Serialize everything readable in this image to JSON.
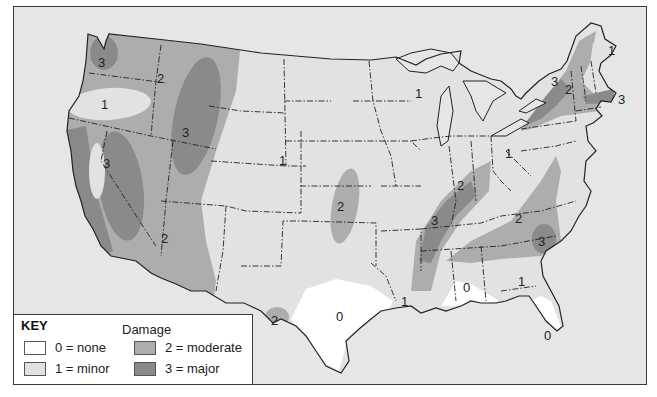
{
  "map": {
    "title": "Damage",
    "colors": {
      "background": "#e6e6e6",
      "none": "#ffffff",
      "minor": "#e2e2e2",
      "moderate": "#adadad",
      "major": "#8a8a8a",
      "border": "#222222"
    },
    "zones": [
      {
        "region": "Northwest Washington coast",
        "value": "3"
      },
      {
        "region": "Idaho / northern Rockies",
        "value": "2"
      },
      {
        "region": "Central Oregon",
        "value": "1"
      },
      {
        "region": "Idaho-Montana border / western Wyoming",
        "value": "3"
      },
      {
        "region": "Sierra Nevada (California-Nevada)",
        "value": "3"
      },
      {
        "region": "Arizona / Utah",
        "value": "2"
      },
      {
        "region": "Wyoming-Colorado border",
        "value": "1"
      },
      {
        "region": "Kansas / central Plains",
        "value": "2"
      },
      {
        "region": "West Texas (Big Bend)",
        "value": "2"
      },
      {
        "region": "Central Texas",
        "value": "0"
      },
      {
        "region": "Louisiana",
        "value": "1"
      },
      {
        "region": "Upper Midwest (Wisconsin/Minnesota)",
        "value": "1"
      },
      {
        "region": "Indiana / Illinois",
        "value": "2"
      },
      {
        "region": "Ohio",
        "value": "1"
      },
      {
        "region": "Tennessee / Missouri bootheel",
        "value": "3"
      },
      {
        "region": "Virginia / North Carolina",
        "value": "2"
      },
      {
        "region": "South Carolina",
        "value": "3"
      },
      {
        "region": "Georgia",
        "value": "1"
      },
      {
        "region": "Gulf coast (Alabama/Mississippi)",
        "value": "0"
      },
      {
        "region": "Florida",
        "value": "0"
      },
      {
        "region": "Upstate New York",
        "value": "3"
      },
      {
        "region": "New England interior",
        "value": "2"
      },
      {
        "region": "Maine",
        "value": "1"
      },
      {
        "region": "Massachusetts coast",
        "value": "3"
      }
    ]
  },
  "key": {
    "title": "KEY",
    "subtitle": "Damage",
    "items": [
      {
        "label": "0 = none",
        "color": "#ffffff"
      },
      {
        "label": "1 = minor",
        "color": "#e2e2e2"
      },
      {
        "label": "2 = moderate",
        "color": "#adadad"
      },
      {
        "label": "3 = major",
        "color": "#8a8a8a"
      }
    ]
  },
  "labels": {
    "wa_coast": "3",
    "idaho": "2",
    "oregon": "1",
    "rockies": "3",
    "sierra": "3",
    "arizona": "2",
    "wyoming": "1",
    "kansas": "2",
    "bigbend": "2",
    "texas": "0",
    "louisiana": "1",
    "wisconsin": "1",
    "indiana": "2",
    "ohio": "1",
    "tennessee": "3",
    "virginia": "2",
    "scarolina": "3",
    "georgia": "1",
    "gulf": "0",
    "florida": "0",
    "newyork": "3",
    "newengland": "2",
    "maine": "1",
    "mass": "3"
  }
}
